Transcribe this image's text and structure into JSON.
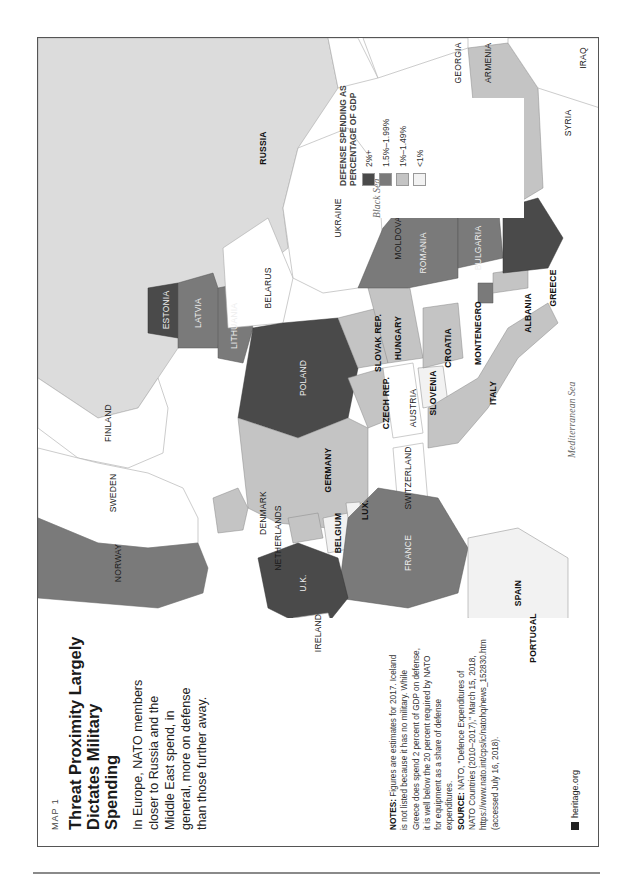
{
  "header": {
    "kicker": "MAP 1",
    "title": "Threat Proximity Largely Dictates Military Spending",
    "intro": "In Europe, NATO members closer to Russia and the Middle East spend, in general, more on defense than those further away."
  },
  "notes": {
    "notes_label": "NOTES:",
    "notes_text": "Figures are estimates for 2017. Iceland is not listed because it has no military. While Greece does spend 2 percent of GDP on defense, it is well below the 20 percent required by NATO for equipment as a share of defense expenditures.",
    "source_label": "SOURCE:",
    "source_text": "NATO, \"Defence Expenditures of NATO Countries (2010–2017),\" March 15, 2018, https://www.nato.int/cps/ic/natohq/news_152830.htm (accessed July 16, 2018)."
  },
  "brand": {
    "icon": "heritage-bell-icon",
    "text": "heritage.org"
  },
  "legend": {
    "title": "DEFENSE SPENDING AS PERCENTAGE OF GDP",
    "items": [
      {
        "label": "2%+",
        "color": "#4a4a4a"
      },
      {
        "label": "1.5%–1.99%",
        "color": "#7a7a7a"
      },
      {
        "label": "1%–1.49%",
        "color": "#c4c4c4"
      },
      {
        "label": "<1%",
        "color": "#f2f2f2"
      }
    ]
  },
  "map": {
    "non_nato_fill": "#ffffff",
    "russia_fill": "#dcdcdc",
    "countries": [
      {
        "name": "NORWAY",
        "tier": "1.5%–1.99%"
      },
      {
        "name": "SWEDEN",
        "tier": "non-NATO"
      },
      {
        "name": "FINLAND",
        "tier": "non-NATO"
      },
      {
        "name": "ESTONIA",
        "tier": "2%+"
      },
      {
        "name": "LATVIA",
        "tier": "1.5%–1.99%"
      },
      {
        "name": "LITHUANIA",
        "tier": "1.5%–1.99%"
      },
      {
        "name": "POLAND",
        "tier": "2%+"
      },
      {
        "name": "U.K.",
        "tier": "2%+"
      },
      {
        "name": "IRELAND",
        "tier": "non-NATO"
      },
      {
        "name": "FRANCE",
        "tier": "1.5%–1.99%"
      },
      {
        "name": "GERMANY",
        "tier": "1%–1.49%"
      },
      {
        "name": "DENMARK",
        "tier": "1%–1.49%"
      },
      {
        "name": "NETHERLANDS",
        "tier": "1%–1.49%"
      },
      {
        "name": "BELGIUM",
        "tier": "<1%"
      },
      {
        "name": "LUX.",
        "tier": "<1%"
      },
      {
        "name": "SWITZERLAND",
        "tier": "non-NATO"
      },
      {
        "name": "SPAIN",
        "tier": "<1%"
      },
      {
        "name": "PORTUGAL",
        "tier": "1%–1.49%"
      },
      {
        "name": "ITALY",
        "tier": "1%–1.49%"
      },
      {
        "name": "CZECH REP.",
        "tier": "1%–1.49%"
      },
      {
        "name": "SLOVAK REP.",
        "tier": "1%–1.49%"
      },
      {
        "name": "AUSTRIA",
        "tier": "non-NATO"
      },
      {
        "name": "HUNGARY",
        "tier": "1%–1.49%"
      },
      {
        "name": "SLOVENIA",
        "tier": "<1%"
      },
      {
        "name": "CROATIA",
        "tier": "1%–1.49%"
      },
      {
        "name": "MONTENEGRO",
        "tier": "1.5%–1.99%"
      },
      {
        "name": "ALBANIA",
        "tier": "1%–1.49%"
      },
      {
        "name": "GREECE",
        "tier": "2%+"
      },
      {
        "name": "ROMANIA",
        "tier": "1.5%–1.99%"
      },
      {
        "name": "BULGARIA",
        "tier": "1.5%–1.99%"
      },
      {
        "name": "TURKEY",
        "tier": "1%–1.49%"
      },
      {
        "name": "BELARUS",
        "tier": "non-NATO"
      },
      {
        "name": "UKRAINE",
        "tier": "non-NATO"
      },
      {
        "name": "MOLDOVA",
        "tier": "non-NATO"
      },
      {
        "name": "RUSSIA",
        "tier": "non-NATO"
      },
      {
        "name": "GEORGIA",
        "tier": "non-NATO"
      },
      {
        "name": "ARMENIA",
        "tier": "non-NATO"
      },
      {
        "name": "SYRIA",
        "tier": "non-NATO"
      },
      {
        "name": "IRAQ",
        "tier": "non-NATO"
      }
    ],
    "seas": [
      "Black Sea",
      "Mediterranean Sea"
    ]
  }
}
